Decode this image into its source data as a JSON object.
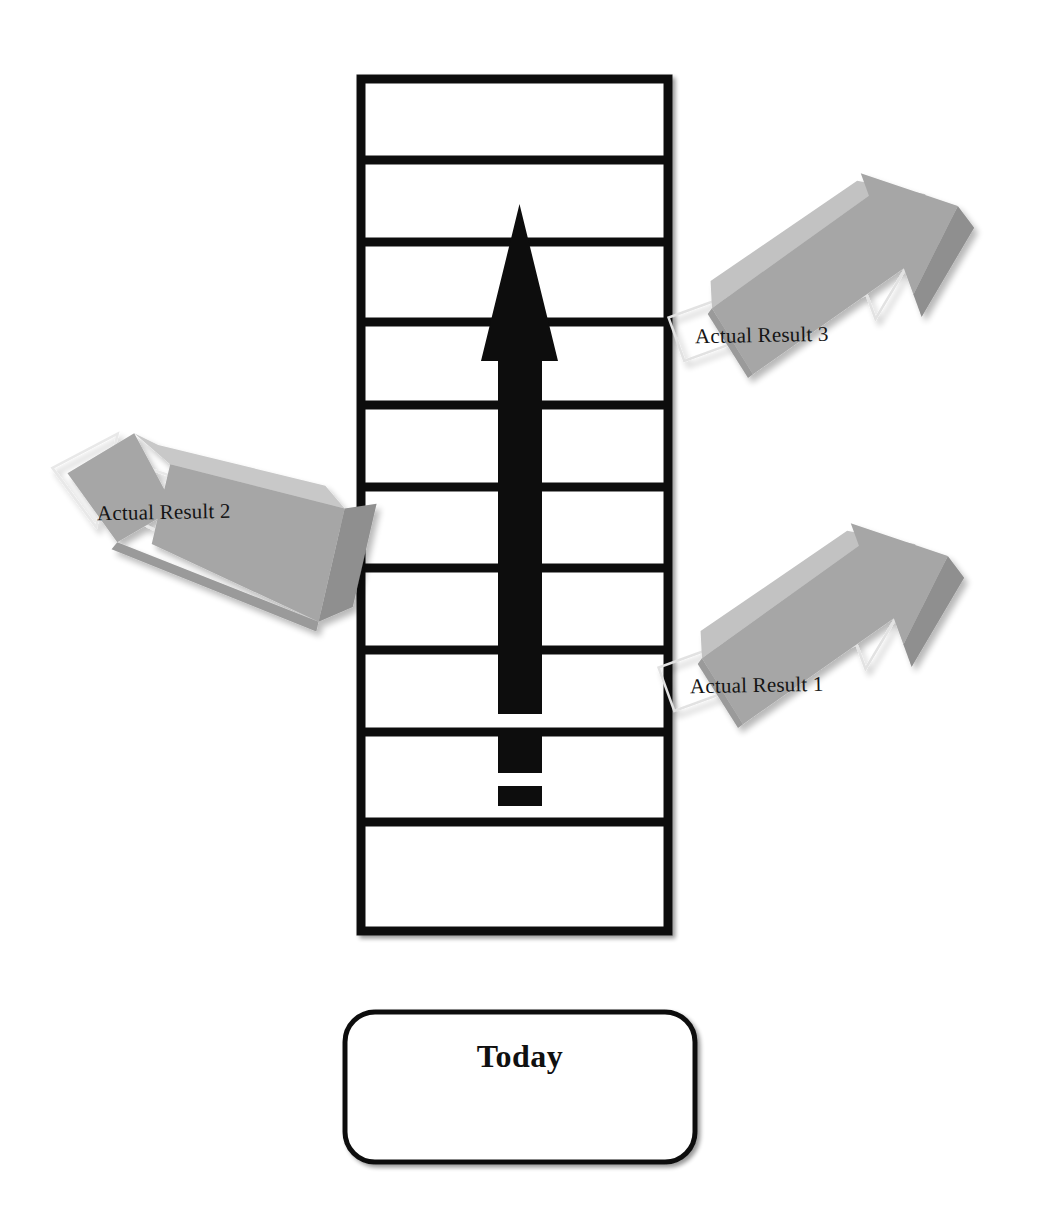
{
  "diagram": {
    "title_present": false,
    "background_color": "#ffffff",
    "ladder": {
      "name": "timeline-ladder",
      "stroke_color": "#101010",
      "fill_color": "#ffffff",
      "left_x": 361,
      "right_x": 668,
      "top_y": 79,
      "bottom_y": 931,
      "rung_y_positions": [
        160,
        242,
        322,
        405,
        487,
        568,
        650,
        732,
        822
      ],
      "rung_count": 9,
      "cell_count": 10,
      "rail_thickness": 9,
      "rung_thickness": 9
    },
    "progress_arrow": {
      "name": "progress-arrow",
      "color": "#0d0d0d",
      "direction": "up",
      "tip_y": 204,
      "head_base_y": 361,
      "head_left_x": 481,
      "head_right_x": 558,
      "shaft_left_x": 498,
      "shaft_right_x": 542,
      "shaft_bottom_y": 714,
      "dashes": [
        {
          "top_y": 729,
          "bottom_y": 773
        },
        {
          "top_y": 786,
          "bottom_y": 806
        }
      ]
    },
    "callouts": [
      {
        "id": "actual-result-3",
        "label": "Actual Result 3",
        "fill_color": "#a6a6a6",
        "shade_color": "#8c8c8c",
        "highlight_color": "#c2c2c2",
        "outline_color": "#d8d8d8",
        "points_to": "ladder-right-upper",
        "direction": "up-right"
      },
      {
        "id": "actual-result-2",
        "label": "Actual Result 2",
        "fill_color": "#a6a6a6",
        "shade_color": "#8c8c8c",
        "highlight_color": "#c2c2c2",
        "outline_color": "#d8d8d8",
        "points_to": "ladder-left-middle",
        "direction": "left"
      },
      {
        "id": "actual-result-1",
        "label": "Actual Result 1",
        "fill_color": "#a6a6a6",
        "shade_color": "#8c8c8c",
        "highlight_color": "#c2c2c2",
        "outline_color": "#d8d8d8",
        "points_to": "ladder-right-lower",
        "direction": "up-right"
      }
    ],
    "today_box": {
      "name": "today-box",
      "label": "Today",
      "x": 345,
      "y": 1012,
      "width": 350,
      "height": 150,
      "corner_radius": 30,
      "stroke_color": "#101010",
      "fill_color": "#ffffff",
      "stroke_width": 5
    }
  }
}
